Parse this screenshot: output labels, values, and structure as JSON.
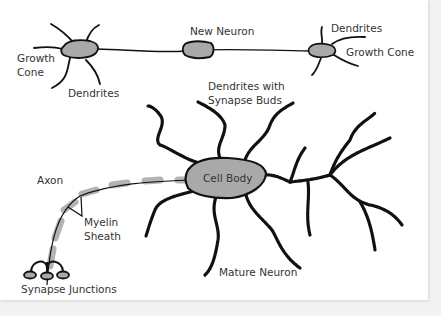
{
  "diagram": {
    "colors": {
      "body_fill": "#a9a9a9",
      "stroke": "#111111",
      "myelin": "#b3b3b3",
      "background": "#ffffff"
    },
    "labels": {
      "new_neuron": "New Neuron",
      "growth_cone_left_1": "Growth",
      "growth_cone_left_2": "Cone",
      "dendrites_left": "Dendrites",
      "dendrites_right": "Dendrites",
      "growth_cone_right": "Growth Cone",
      "dendrites_synapse_1": "Dendrites with",
      "dendrites_synapse_2": "Synapse Buds",
      "axon": "Axon",
      "cell_body": "Cell Body",
      "myelin_1": "Myelin",
      "myelin_2": "Sheath",
      "synapse_junctions": "Synapse Junctions",
      "mature_neuron": "Mature Neuron"
    }
  }
}
